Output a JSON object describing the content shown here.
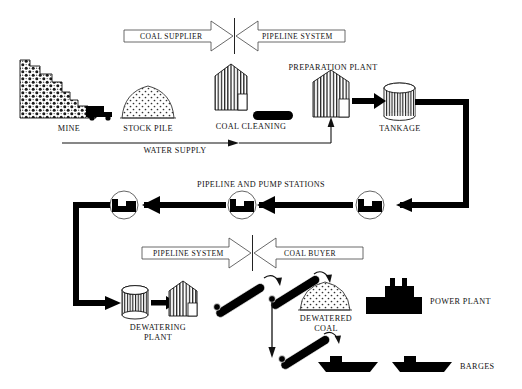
{
  "diagram": {
    "title_banners": [
      {
        "name": "top-banner",
        "left_label": "COAL SUPPLIER",
        "right_label": "PIPELINE SYSTEM"
      },
      {
        "name": "bottom-banner",
        "left_label": "PIPELINE SYSTEM",
        "right_label": "COAL BUYER"
      }
    ],
    "nodes": [
      {
        "id": "mine",
        "label": "MINE",
        "icon": "mine-mountain-icon"
      },
      {
        "id": "truck",
        "label": "",
        "icon": "haul-truck-icon"
      },
      {
        "id": "stock-pile",
        "label": "STOCK PILE",
        "icon": "coal-dome-icon"
      },
      {
        "id": "coal-cleaning",
        "label": "COAL CLEANING",
        "icon": "conveyor-oval-icon"
      },
      {
        "id": "preparation-plant",
        "label": "PREPARATION PLANT",
        "icon": "plant-building-icon"
      },
      {
        "id": "tankage",
        "label": "TANKAGE",
        "icon": "tank-cylinder-icon"
      },
      {
        "id": "water-supply",
        "label": "WATER SUPPLY",
        "icon": "water-line-icon"
      },
      {
        "id": "pump-stations",
        "label": "PIPELINE AND PUMP STATIONS",
        "icon": "pump-station-icon"
      },
      {
        "id": "dewatering-plant",
        "label": "DEWATERING\nPLANT",
        "label_line1": "DEWATERING",
        "label_line2": "PLANT",
        "icon": "plant-building-icon"
      },
      {
        "id": "dewatered-coal",
        "label": "DEWATERED\nCOAL",
        "label_line1": "DEWATERED",
        "label_line2": "COAL",
        "icon": "coal-dome-icon"
      },
      {
        "id": "power-plant",
        "label": "POWER PLANT",
        "icon": "power-plant-icon"
      },
      {
        "id": "barges",
        "label": "BARGES",
        "icon": "barge-ship-icon"
      }
    ],
    "colors": {
      "ink": "#000000",
      "line": "#111111",
      "paper": "#ffffff"
    }
  }
}
